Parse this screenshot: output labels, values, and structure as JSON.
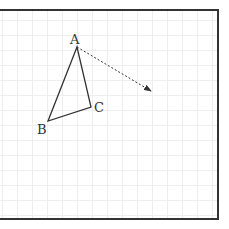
{
  "diagram": {
    "type": "geometry-translation",
    "frame": {
      "x": -2,
      "y": 10,
      "width": 220,
      "height": 209,
      "stroke": "#333333",
      "stroke_width": 2
    },
    "grid": {
      "spacing": 15,
      "offset_x": 2,
      "offset_y": 5,
      "color": "#eeeeee"
    },
    "triangle": {
      "stroke": "#333333",
      "vertices": [
        {
          "name": "A",
          "x": 77,
          "y": 47,
          "label": "A",
          "label_x": 70,
          "label_y": 44
        },
        {
          "name": "B",
          "x": 48,
          "y": 121,
          "label": "B",
          "label_x": 37,
          "label_y": 134
        },
        {
          "name": "C",
          "x": 91,
          "y": 107,
          "label": "C",
          "label_x": 94,
          "label_y": 112
        }
      ]
    },
    "vector": {
      "from": {
        "x": 77,
        "y": 47
      },
      "to": {
        "x": 151,
        "y": 91
      },
      "style": "dashed",
      "color": "#333333"
    }
  }
}
